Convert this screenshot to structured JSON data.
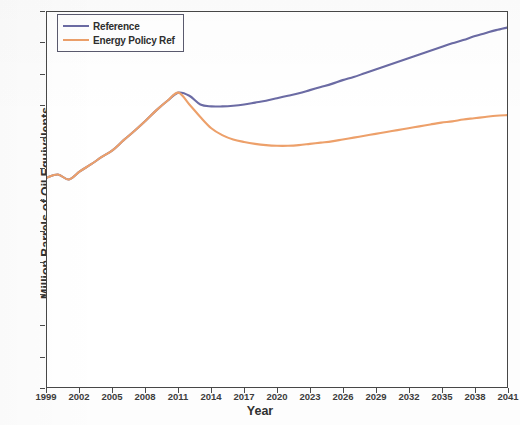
{
  "chart_data": {
    "type": "line",
    "title": "",
    "xlabel": "Year",
    "ylabel": "Million Barrels of Oil Equivalents",
    "xlim": [
      1999,
      2041
    ],
    "ylim": [
      0,
      60
    ],
    "ytick_labels": [
      "0",
      "5",
      "10",
      "15",
      "20",
      "25",
      "30",
      "35",
      "40",
      "45",
      "50",
      "55",
      "60"
    ],
    "ytick_values": [
      0,
      5,
      10,
      15,
      20,
      25,
      30,
      35,
      40,
      45,
      50,
      55,
      60
    ],
    "xtick_labels": [
      "1999",
      "2002",
      "2005",
      "2008",
      "2011",
      "2014",
      "2017",
      "2020",
      "2023",
      "2026",
      "2029",
      "2032",
      "2035",
      "2038",
      "2041"
    ],
    "xtick_values": [
      1999,
      2002,
      2005,
      2008,
      2011,
      2014,
      2017,
      2020,
      2023,
      2026,
      2029,
      2032,
      2035,
      2038,
      2041
    ],
    "grid": false,
    "legend_position": "upper left",
    "legend_entries": [
      "Reference",
      "Energy Policy Ref"
    ],
    "colors": {
      "reference": "#6b6ba4",
      "energy_policy_ref": "#eda06a",
      "axis": "#474747",
      "text": "#313131",
      "background": "#ffffff"
    },
    "x": [
      1999,
      2000,
      2001,
      2002,
      2003,
      2004,
      2005,
      2006,
      2007,
      2008,
      2009,
      2010,
      2011,
      2012,
      2013,
      2014,
      2015,
      2016,
      2017,
      2018,
      2019,
      2020,
      2021,
      2022,
      2023,
      2024,
      2025,
      2026,
      2027,
      2028,
      2029,
      2030,
      2031,
      2032,
      2033,
      2034,
      2035,
      2036,
      2037,
      2038,
      2039,
      2040,
      2041
    ],
    "series": [
      {
        "name": "Reference",
        "color": "#6b6ba4",
        "values": [
          33.5,
          34.0,
          33.2,
          34.5,
          35.6,
          36.8,
          37.9,
          39.5,
          41.0,
          42.6,
          44.3,
          45.8,
          47.1,
          46.6,
          45.2,
          44.9,
          44.9,
          45.0,
          45.2,
          45.5,
          45.8,
          46.2,
          46.6,
          47.0,
          47.5,
          48.0,
          48.5,
          49.1,
          49.6,
          50.2,
          50.8,
          51.4,
          52.0,
          52.6,
          53.2,
          53.8,
          54.4,
          55.0,
          55.5,
          56.1,
          56.6,
          57.1,
          57.5
        ]
      },
      {
        "name": "Energy Policy Ref",
        "color": "#eda06a",
        "values": [
          33.5,
          34.0,
          33.2,
          34.5,
          35.6,
          36.8,
          37.9,
          39.5,
          41.0,
          42.6,
          44.3,
          45.8,
          47.1,
          45.2,
          43.2,
          41.4,
          40.3,
          39.6,
          39.2,
          38.9,
          38.7,
          38.6,
          38.6,
          38.7,
          38.9,
          39.1,
          39.3,
          39.6,
          39.9,
          40.2,
          40.5,
          40.8,
          41.1,
          41.4,
          41.7,
          42.0,
          42.3,
          42.5,
          42.8,
          43.0,
          43.2,
          43.4,
          43.5
        ]
      }
    ]
  }
}
